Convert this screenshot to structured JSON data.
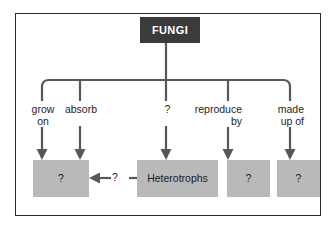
{
  "diagram": {
    "title_node": {
      "label": "FUNGI",
      "fill": "#3b3b3b",
      "text_color": "#ffffff"
    },
    "frame": {
      "border_color": "#2a2a2a",
      "background": "#ffffff"
    },
    "node_fill": "#b9b9b9",
    "connector_color": "#58585a",
    "branches": [
      {
        "name": "grow-on",
        "label_line1": "grow",
        "label_line2": "on",
        "align": "center"
      },
      {
        "name": "absorb",
        "label_line1": "absorb",
        "label_line2": "",
        "align": "center"
      },
      {
        "name": "unknown",
        "label_line1": "?",
        "label_line2": "",
        "align": "center"
      },
      {
        "name": "reproduce-by",
        "label_line1": "reproduce",
        "label_line2": "by",
        "align": "right"
      },
      {
        "name": "made-up-of",
        "label_line1": "made",
        "label_line2": "up of",
        "align": "right"
      }
    ],
    "leaf_nodes": [
      {
        "name": "leaf-grow-on",
        "label": "?"
      },
      {
        "name": "leaf-absorb",
        "label": "Heterotrophs"
      },
      {
        "name": "leaf-reproduce-by",
        "label": "?"
      },
      {
        "name": "leaf-made-up-of",
        "label": "?"
      }
    ],
    "cross_link": {
      "label": "?",
      "direction": "left"
    }
  }
}
